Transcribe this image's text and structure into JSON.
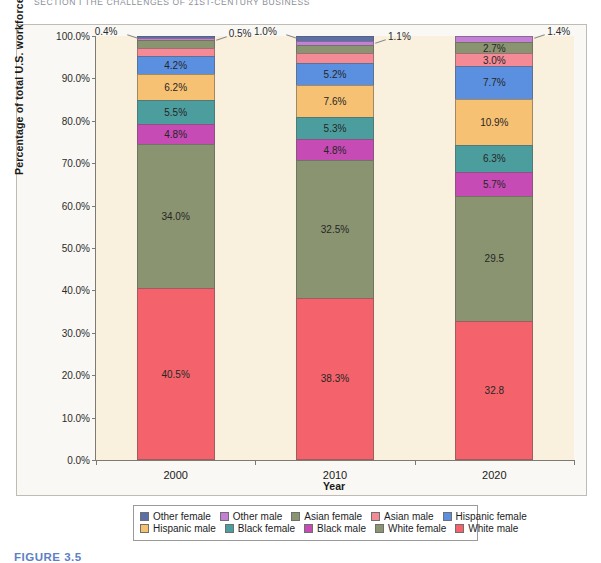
{
  "running_header": "SECTION I   THE CHALLENGES OF 21ST-CENTURY BUSINESS",
  "figure_caption": "FIGURE 3.5",
  "chart_data": {
    "type": "bar",
    "subtype": "stacked-100-percent",
    "title": "",
    "xlabel": "Year",
    "ylabel": "Percentage of total U.S. workforce",
    "categories": [
      "2000",
      "2010",
      "2020"
    ],
    "ylim": [
      0,
      100
    ],
    "ytick_labels": [
      "0.0%",
      "10.0%",
      "20.0%",
      "30.0%",
      "40.0%",
      "50.0%",
      "60.0%",
      "70.0%",
      "80.0%",
      "90.0%",
      "100.0%"
    ],
    "ytick_values": [
      0,
      10,
      20,
      30,
      40,
      50,
      60,
      70,
      80,
      90,
      100
    ],
    "grid": false,
    "legend_position": "bottom",
    "plot_background": "#faf0de",
    "chart_background": "#f9f8f4",
    "series": [
      {
        "name": "White male",
        "color": "#f4636b",
        "values": [
          40.5,
          38.3,
          32.8
        ],
        "labels": [
          "40.5%",
          "38.3%",
          "32.8"
        ]
      },
      {
        "name": "White female",
        "color": "#8a9470",
        "values": [
          34.0,
          32.5,
          29.5
        ],
        "labels": [
          "34.0%",
          "32.5%",
          "29.5"
        ]
      },
      {
        "name": "Black male",
        "color": "#c74bb4",
        "values": [
          4.8,
          4.8,
          5.7
        ],
        "labels": [
          "4.8%",
          "4.8%",
          "5.7%"
        ]
      },
      {
        "name": "Black female",
        "color": "#4c9e9e",
        "values": [
          5.5,
          5.3,
          6.3
        ],
        "labels": [
          "5.5%",
          "5.3%",
          "6.3%"
        ]
      },
      {
        "name": "Hispanic male",
        "color": "#f7c173",
        "values": [
          6.2,
          7.6,
          10.9
        ],
        "labels": [
          "6.2%",
          "7.6%",
          "10.9%"
        ]
      },
      {
        "name": "Hispanic female",
        "color": "#5b90e0",
        "values": [
          4.2,
          5.2,
          7.7
        ],
        "labels": [
          "4.2%",
          "5.2%",
          "7.7%"
        ]
      },
      {
        "name": "Asian male",
        "color": "#f48a96",
        "values": [
          2.1,
          2.2,
          3.0
        ],
        "labels": [
          "2.1%",
          "2.2%",
          "3.0%"
        ]
      },
      {
        "name": "Asian female",
        "color": "#8a9470",
        "values": [
          1.8,
          1.9,
          2.7
        ],
        "labels": [
          "1.8%",
          "1.9%",
          "2.7%"
        ]
      },
      {
        "name": "Other male",
        "color": "#c47fd6",
        "values": [
          0.5,
          1.1,
          1.4
        ],
        "labels": [
          "0.5%",
          "1.1%",
          "1.4%"
        ]
      },
      {
        "name": "Other female",
        "color": "#5b6fa8",
        "values": [
          0.4,
          1.0,
          0.0
        ],
        "labels": [
          "0.4%",
          "1.0%",
          ""
        ]
      }
    ],
    "callouts": [
      {
        "text": "0.4%",
        "series": "Other female",
        "category": "2000",
        "side": "left"
      },
      {
        "text": "0.5%",
        "series": "Other male",
        "category": "2000",
        "side": "right"
      },
      {
        "text": "1.0%",
        "series": "Other female",
        "category": "2010",
        "side": "left"
      },
      {
        "text": "1.1%",
        "series": "Other male",
        "category": "2010",
        "side": "right"
      },
      {
        "text": "1.4%",
        "series": "Other male",
        "category": "2020",
        "side": "right"
      }
    ],
    "legend_rows": [
      [
        "Other female",
        "Other male",
        "Asian female",
        "Asian male",
        "Hispanic female"
      ],
      [
        "Hispanic male",
        "Black female",
        "Black male",
        "White female",
        "White male"
      ]
    ]
  }
}
